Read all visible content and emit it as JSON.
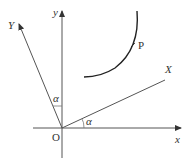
{
  "diagram": {
    "labels": {
      "y_axis": "y",
      "x_axis": "x",
      "rotated_y_axis": "Y",
      "rotated_x_axis": "X",
      "origin": "O",
      "point": "P",
      "angle_y": "α",
      "angle_x": "α"
    },
    "colors": {
      "axis": "#555555",
      "curve": "#222222",
      "text": "#333333"
    }
  }
}
